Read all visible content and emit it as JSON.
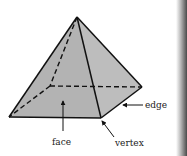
{
  "figure": {
    "colors": {
      "face_fill": "#b5b5b5",
      "edge_stroke": "#111111",
      "label_text": "#1a1a1a",
      "page_edge": "#555555"
    }
  },
  "labels": {
    "edge": "edge",
    "face": "face",
    "vertex": "vertex"
  }
}
